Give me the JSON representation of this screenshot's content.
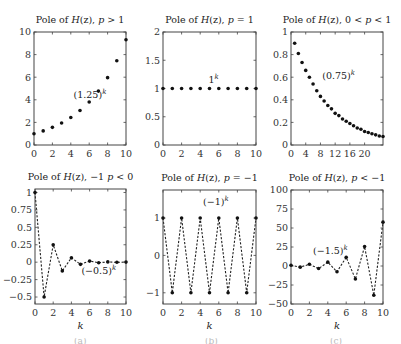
{
  "figure": {
    "caption_visible": ""
  },
  "chart_data": [
    {
      "type": "scatter",
      "title": "Pole of H(z), p > 1",
      "title_parts": {
        "prefix": "Pole of ",
        "italic": "H",
        "mid": "(z), ",
        "var": "p",
        "rel": " > 1"
      },
      "xlabel": "",
      "ylabel": "",
      "xlim": [
        0,
        10
      ],
      "ylim": [
        0,
        10
      ],
      "xticks": [
        0,
        2,
        4,
        6,
        8,
        10
      ],
      "yticks": [
        0,
        2,
        4,
        6,
        8,
        10
      ],
      "annotation": {
        "text": "(1.25)",
        "sup": "k",
        "x": 4.3,
        "y": 4.2
      },
      "connect": false,
      "x": [
        0,
        1,
        2,
        3,
        4,
        5,
        6,
        7,
        8,
        9,
        10
      ],
      "values": [
        1.0,
        1.25,
        1.56,
        1.95,
        2.44,
        3.05,
        3.81,
        4.77,
        5.96,
        7.45,
        9.31
      ],
      "box": {
        "left": 34,
        "top": 32,
        "right": 126,
        "bottom": 145
      }
    },
    {
      "type": "scatter",
      "title": "Pole of H(z), p = 1",
      "title_parts": {
        "prefix": "Pole of ",
        "italic": "H",
        "mid": "(z), ",
        "var": "p",
        "rel": " = 1"
      },
      "xlabel": "",
      "ylabel": "",
      "xlim": [
        0,
        10
      ],
      "ylim": [
        0,
        2
      ],
      "xticks": [
        0,
        2,
        4,
        6,
        8,
        10
      ],
      "yticks": [
        0,
        0.5,
        1,
        1.5,
        2
      ],
      "ytick_labels": [
        "0",
        "0.5",
        "1",
        "1.5",
        "2"
      ],
      "annotation": {
        "text": "1",
        "sup": "k",
        "x": 4.9,
        "y": 1.1
      },
      "connect": false,
      "x": [
        0,
        1,
        2,
        3,
        4,
        5,
        6,
        7,
        8,
        9,
        10
      ],
      "values": [
        1,
        1,
        1,
        1,
        1,
        1,
        1,
        1,
        1,
        1,
        1
      ],
      "box": {
        "left": 163,
        "top": 32,
        "right": 256,
        "bottom": 145
      }
    },
    {
      "type": "scatter",
      "title": "Pole of H(z), 0 < p < 1",
      "title_parts": {
        "prefix": "Pole of ",
        "italic": "H",
        "mid": "(z), 0 < ",
        "var": "p",
        "rel": " < 1"
      },
      "xlabel": "",
      "ylabel": "",
      "xlim": [
        0,
        25
      ],
      "ylim": [
        0,
        1
      ],
      "xticks": [
        0,
        4,
        8,
        12,
        16,
        20
      ],
      "yticks": [
        0,
        0.2,
        0.4,
        0.6,
        0.8,
        1
      ],
      "ytick_labels": [
        "0",
        "0.2",
        "0.4",
        "0.6",
        "0.8",
        "1"
      ],
      "annotation": {
        "text": "(0.75)",
        "sup": "k",
        "x": 8.5,
        "y": 0.58
      },
      "connect": false,
      "x": [
        1,
        2,
        3,
        4,
        5,
        6,
        7,
        8,
        9,
        10,
        11,
        12,
        13,
        14,
        15,
        16,
        17,
        18,
        19,
        20,
        21,
        22,
        23,
        24,
        25
      ],
      "values": [
        0.9,
        0.81,
        0.73,
        0.66,
        0.6,
        0.54,
        0.48,
        0.43,
        0.39,
        0.35,
        0.32,
        0.28,
        0.26,
        0.23,
        0.21,
        0.19,
        0.17,
        0.15,
        0.14,
        0.12,
        0.11,
        0.1,
        0.09,
        0.08,
        0.075
      ],
      "box": {
        "left": 291,
        "top": 32,
        "right": 383,
        "bottom": 145
      }
    },
    {
      "type": "line",
      "title": "Pole of H(z), -1 p < 0",
      "title_parts": {
        "prefix": "Pole of ",
        "italic": "H",
        "mid": "(z), −1 ",
        "var": "p",
        "rel": " < 0"
      },
      "xlabel": "k",
      "ylabel": "",
      "xlim": [
        0,
        10
      ],
      "ylim": [
        -0.6,
        1.05
      ],
      "xticks": [
        0,
        2,
        4,
        6,
        8,
        10
      ],
      "yticks": [
        -0.5,
        -0.25,
        0,
        0.25,
        0.5,
        0.75,
        1
      ],
      "ytick_labels": [
        "−0.5",
        "−0.25",
        "0",
        "0.25",
        "0.5",
        "0.75",
        "1"
      ],
      "annotation": {
        "text": "(−0.5)",
        "sup": "k",
        "x": 5.1,
        "y": -0.17
      },
      "connect": true,
      "linestyle": "dashed",
      "x": [
        0,
        1,
        2,
        3,
        4,
        5,
        6,
        7,
        8,
        9,
        10
      ],
      "values": [
        1,
        -0.5,
        0.25,
        -0.125,
        0.0625,
        -0.03125,
        0.015625,
        -0.0078,
        0.0039,
        -0.002,
        0.001
      ],
      "box": {
        "left": 35,
        "top": 189,
        "right": 126,
        "bottom": 304
      }
    },
    {
      "type": "line",
      "title": "Pole of H(z), p = -1",
      "title_parts": {
        "prefix": "Pole of ",
        "italic": "H",
        "mid": "(z), ",
        "var": "p",
        "rel": " = −1"
      },
      "xlabel": "k",
      "ylabel": "",
      "xlim": [
        0,
        10
      ],
      "ylim": [
        -1.3,
        1.75
      ],
      "xticks": [
        0,
        2,
        4,
        6,
        8,
        10
      ],
      "yticks": [
        -1,
        0,
        1
      ],
      "ytick_labels": [
        "−1",
        "0",
        "1"
      ],
      "annotation": {
        "text": "(−1)",
        "sup": "k",
        "x": 4.3,
        "y": 1.35
      },
      "connect": true,
      "linestyle": "dashed",
      "x": [
        0,
        1,
        2,
        3,
        4,
        5,
        6,
        7,
        8,
        9,
        10
      ],
      "values": [
        1,
        -1,
        1,
        -1,
        1,
        -1,
        1,
        -1,
        1,
        -1,
        1
      ],
      "box": {
        "left": 163,
        "top": 190,
        "right": 256,
        "bottom": 304
      }
    },
    {
      "type": "line",
      "title": "Pole of H(z), p < -1",
      "title_parts": {
        "prefix": "Pole of ",
        "italic": "H",
        "mid": "(z), ",
        "var": "p",
        "rel": " < −1"
      },
      "xlabel": "k",
      "ylabel": "",
      "xlim": [
        0,
        10
      ],
      "ylim": [
        -50,
        100
      ],
      "xticks": [
        0,
        2,
        4,
        6,
        8,
        10
      ],
      "yticks": [
        -50,
        -25,
        0,
        25,
        50,
        75,
        100
      ],
      "ytick_labels": [
        "−50",
        "−25",
        "0",
        "25",
        "50",
        "75",
        "100"
      ],
      "annotation": {
        "text": "(−1.5)",
        "sup": "k",
        "x": 2.4,
        "y": 16
      },
      "connect": true,
      "linestyle": "dashed",
      "x": [
        0,
        1,
        2,
        3,
        4,
        5,
        6,
        7,
        8,
        9,
        10
      ],
      "values": [
        1,
        -1.5,
        2.25,
        -3.375,
        5.06,
        -7.59,
        11.39,
        -17.09,
        25.63,
        -38.44,
        57.67
      ],
      "box": {
        "left": 291,
        "top": 190,
        "right": 383,
        "bottom": 304
      }
    }
  ]
}
